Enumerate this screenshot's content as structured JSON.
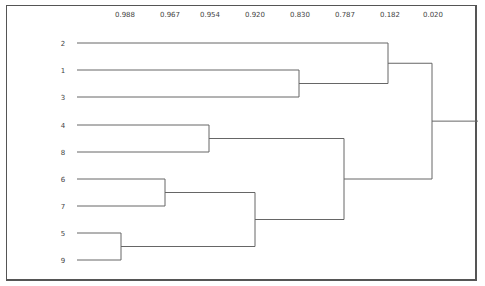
{
  "chart_data": {
    "type": "dendrogram",
    "title": "",
    "scale_labels": [
      "0.988",
      "0.967",
      "0.954",
      "0.920",
      "0.830",
      "0.787",
      "0.182",
      "0.020"
    ],
    "scale_positions_x": [
      125,
      170,
      210,
      255,
      300,
      345,
      390,
      433
    ],
    "leaf_order": [
      "2",
      "1",
      "3",
      "4",
      "8",
      "6",
      "7",
      "5",
      "9"
    ],
    "leaf_y": [
      43,
      70,
      97,
      125,
      152,
      179,
      206,
      233,
      260
    ],
    "leaf_x": 77,
    "merges": [
      {
        "left": "5",
        "right": "9",
        "height": 0.988,
        "x": 121
      },
      {
        "left": "6",
        "right": "7",
        "height": 0.967,
        "x": 165
      },
      {
        "left": "4",
        "right": "8",
        "height": 0.954,
        "x": 209
      },
      {
        "left": "(6,7)",
        "right": "(5,9)",
        "height": 0.92,
        "x": 255
      },
      {
        "left": "1",
        "right": "3",
        "height": 0.83,
        "x": 299
      },
      {
        "left": "(4,8)",
        "right": "(6,7,5,9)",
        "height": 0.787,
        "x": 344
      },
      {
        "left": "2",
        "right": "(1,3)",
        "height": 0.182,
        "x": 388
      },
      {
        "left": "(2,1,3)",
        "right": "(4,8,6,7,5,9)",
        "height": 0.02,
        "x": 432
      }
    ],
    "root_tail_x": 478
  }
}
